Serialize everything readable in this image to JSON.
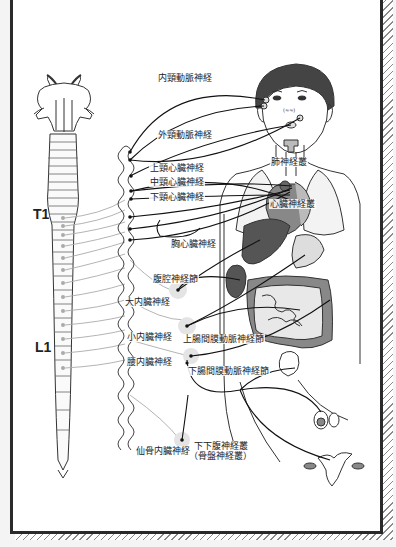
{
  "diagram": {
    "title": "",
    "spinal_levels": {
      "t1": "T1",
      "l1": "L1"
    },
    "labels": {
      "internal_carotid_nerve": "内頸動脈神経",
      "external_carotid_nerve": "外頸動脈神経",
      "superior_cervical_cardiac_nerve": "上頸心臓神経",
      "middle_cervical_cardiac_nerve": "中頸心臓神経",
      "inferior_cervical_cardiac_nerve": "下頸心臓神経",
      "pulmonary_plexus": "肺神経叢",
      "cardiac_plexus": "心臓神経叢",
      "thoracic_cardiac_nerve": "胸心臓神経",
      "celiac_ganglion": "腹腔神経節",
      "greater_splanchnic_nerve": "大内臓神経",
      "lesser_splanchnic_nerve": "小内臓神経",
      "superior_mesenteric_ganglion": "上腸間膜動脈神経節",
      "lumbar_splanchnic_nerve": "腰内臓神経",
      "inferior_mesenteric_ganglion": "下腸間膜動脈神経節",
      "sacral_splanchnic_nerve": "仙骨内臓神経",
      "inferior_hypogastric_plexus": "下下腹神経叢",
      "pelvic_plexus": "（骨盤神経叢）"
    },
    "colors": {
      "line": "#1a1a1a",
      "organ_dark": "#555555",
      "organ_mid": "#8c8c8c",
      "organ_light": "#c8c8c8",
      "hair": "#444444",
      "ganglion_glow": "#e6e6e6"
    }
  }
}
